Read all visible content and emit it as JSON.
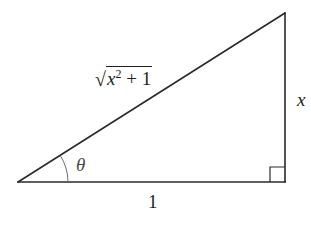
{
  "figure": {
    "type": "right-triangle",
    "colors": {
      "stroke": "#2a2a2a",
      "arc": "#6a6a6a",
      "text": "#1e1e1e",
      "background": "#ffffff"
    }
  },
  "labels": {
    "hypotenuse": {
      "radical_symbol": "√",
      "var": "x",
      "exponent": "2",
      "operator": " + ",
      "constant": "1"
    },
    "angle": "θ",
    "adjacent_side": "1",
    "opposite_side": "x"
  },
  "marks": {
    "right_angle_marker": true,
    "angle_arc": true
  }
}
